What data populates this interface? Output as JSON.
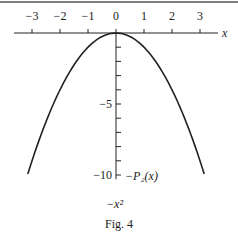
{
  "figure": {
    "caption": "Fig. 4",
    "x_axis_label": "x",
    "curve_label": "−P₂(x)",
    "sublabel": "−x²"
  },
  "chart_data": {
    "type": "line",
    "title": "",
    "caption": "Fig. 4",
    "xlabel": "x",
    "ylabel": "",
    "xlim": [
      -3.5,
      3.5
    ],
    "ylim": [
      -10.5,
      0.5
    ],
    "x_ticks": [
      -3,
      -2,
      -1,
      0,
      1,
      2,
      3
    ],
    "x_tick_labels": [
      "−3",
      "−2",
      "−1",
      "0",
      "1",
      "2",
      "3"
    ],
    "y_ticks": [
      0,
      -1,
      -2,
      -3,
      -4,
      -5,
      -6,
      -7,
      -8,
      -9,
      -10
    ],
    "y_tick_labels": [
      {
        "value": -5,
        "label": "−5"
      },
      {
        "value": -10,
        "label": "−10"
      }
    ],
    "grid": false,
    "legend": null,
    "series": [
      {
        "name": "−P₂(x) = −x²",
        "function": "-x^2",
        "x": [
          -3.15,
          -3,
          -2.5,
          -2,
          -1.5,
          -1,
          -0.5,
          0,
          0.5,
          1,
          1.5,
          2,
          2.5,
          3,
          3.15
        ],
        "y": [
          -9.92,
          -9,
          -6.25,
          -4,
          -2.25,
          -1,
          -0.25,
          0,
          -0.25,
          -1,
          -2.25,
          -4,
          -6.25,
          -9,
          -9.92
        ]
      }
    ],
    "annotations": [
      {
        "text": "−P₂(x)",
        "near": [
          0.35,
          -10
        ]
      },
      {
        "text": "−x²",
        "near": [
          0,
          -11.8
        ]
      }
    ]
  },
  "colors": {
    "ink": "#222222",
    "background": "#ffffff",
    "border": "#555555"
  }
}
